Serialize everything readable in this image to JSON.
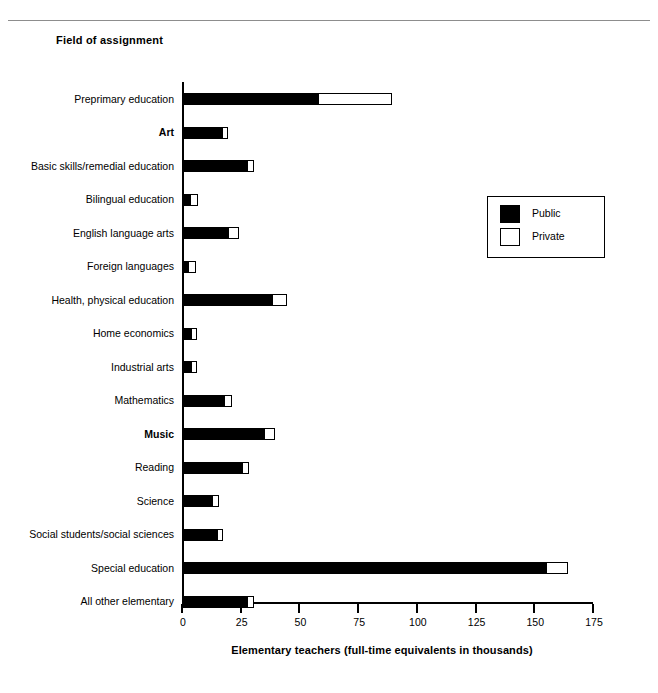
{
  "figure": {
    "axis_heading": "Field of assignment"
  },
  "legend": {
    "position": "inside-right",
    "items": [
      {
        "label": "Public",
        "swatch": "black-square-icon",
        "color": "#000000"
      },
      {
        "label": "Private",
        "swatch": "white-square-icon",
        "color": "#ffffff"
      }
    ]
  },
  "chart_data": {
    "type": "bar",
    "orientation": "horizontal",
    "stacked": true,
    "title": "",
    "subtitle": "",
    "xlabel": "Elementary teachers (full-time equivalents in thousands)",
    "ylabel": "Field of assignment",
    "xlim": [
      0,
      175
    ],
    "xticks": [
      0,
      25,
      50,
      75,
      100,
      125,
      150,
      175
    ],
    "grid": false,
    "categories": [
      "Preprimary education",
      "Art",
      "Basic skills/remedial education",
      "Bilingual education",
      "English language arts",
      "Foreign languages",
      "Health, physical education",
      "Home economics",
      "Industrial arts",
      "Mathematics",
      "Music",
      "Reading",
      "Science",
      "Social students/social sciences",
      "Special education",
      "All other elementary"
    ],
    "category_labels_bold": [
      "Art",
      "Music"
    ],
    "series": [
      {
        "name": "Public",
        "color": "#000000",
        "values": [
          58,
          17,
          27.5,
          3.2,
          19.7,
          2.6,
          38.4,
          3.8,
          3.7,
          18,
          35,
          25.4,
          12.8,
          14.7,
          155,
          27.5
        ]
      },
      {
        "name": "Private",
        "color": "#ffffff",
        "values": [
          31.5,
          2.7,
          3,
          3.6,
          4.5,
          3.2,
          6.2,
          2.8,
          2.9,
          3.4,
          4.6,
          3.1,
          3,
          2.9,
          9.5,
          3.3
        ]
      }
    ],
    "totals": [
      89.5,
      19.7,
      30.5,
      6.8,
      24.2,
      5.8,
      44.6,
      6.6,
      6.6,
      21.4,
      39.6,
      28.5,
      15.8,
      17.6,
      164.5,
      30.8
    ]
  }
}
